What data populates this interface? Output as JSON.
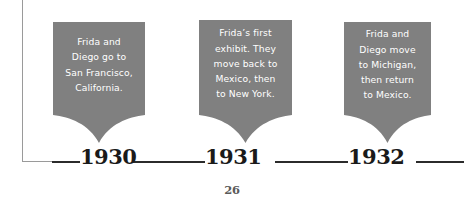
{
  "page": {
    "page_number": "26",
    "banner_color": "#808080",
    "banner_text_color": "#ffffff",
    "axis_color": "#2b2b2b",
    "rule_color": "#9a9a9a",
    "year_color": "#1a1a1a"
  },
  "timeline": {
    "events": [
      {
        "year": "1930",
        "text": "Frida and\nDiego go to\nSan Francisco,\nCalifornia."
      },
      {
        "year": "1931",
        "text": "Frida’s first\nexhibit. They\nmove back to\nMexico, then\nto New York."
      },
      {
        "year": "1932",
        "text": "Frida and\nDiego move\nto Michigan,\nthen return\nto Mexico."
      }
    ]
  }
}
